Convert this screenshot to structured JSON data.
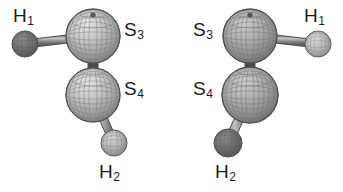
{
  "figure": {
    "background_color": "#ffffff",
    "ink_color": "#1b1b1b",
    "width": 343,
    "height": 192,
    "caption": ""
  },
  "palette": {
    "sulfur_mesh_light": "#cfcfcf",
    "sulfur_mesh_mid": "#9a9a9a",
    "sulfur_mesh_dark": "#6e6e6e",
    "sulfur_outline": "#4f4f4f",
    "hydrogen_dark": "#6b6b6b",
    "hydrogen_light": "#b5b5b5",
    "bond_light": "#b0b0b0",
    "bond_dark": "#6a6a6a",
    "bond_outline": "#4a4a4a"
  },
  "molecules": [
    {
      "id": "molecule-left",
      "name": "disulfane-conformer-left",
      "atoms": [
        {
          "id": "left-h1",
          "element": "H",
          "label": "H",
          "sublabel": "1",
          "kind": "hydrogen",
          "shade": "dark",
          "cx": 25,
          "cy": 44,
          "r": 13,
          "label_x": 13,
          "label_y": 6
        },
        {
          "id": "left-s3",
          "element": "S",
          "label": "S",
          "sublabel": "3",
          "kind": "sulfur",
          "shade": "light",
          "cx": 93,
          "cy": 36,
          "r": 27,
          "label_x": 124,
          "label_y": 20
        },
        {
          "id": "left-s4",
          "element": "S",
          "label": "S",
          "sublabel": "4",
          "kind": "sulfur",
          "shade": "light",
          "cx": 93,
          "cy": 95,
          "r": 27,
          "label_x": 124,
          "label_y": 79
        },
        {
          "id": "left-h2",
          "element": "H",
          "label": "H",
          "sublabel": "2",
          "kind": "hydrogen",
          "shade": "light",
          "cx": 114,
          "cy": 143,
          "r": 13,
          "label_x": 99,
          "label_y": 162
        }
      ],
      "bonds": [
        {
          "id": "left-bond-h1-s3",
          "from": "left-h1",
          "to": "left-s3",
          "width": 7,
          "style": "shaded-cylinder"
        },
        {
          "id": "left-bond-s3-s4",
          "from": "left-s3",
          "to": "left-s4",
          "width": 9,
          "style": "shaded-cylinder"
        },
        {
          "id": "left-bond-s4-h2",
          "from": "left-s4",
          "to": "left-h2",
          "width": 7,
          "style": "shaded-cylinder"
        }
      ]
    },
    {
      "id": "molecule-right",
      "name": "disulfane-conformer-right",
      "atoms": [
        {
          "id": "right-s3",
          "element": "S",
          "label": "S",
          "sublabel": "3",
          "kind": "sulfur",
          "shade": "mid",
          "cx": 79,
          "cy": 36,
          "r": 27,
          "label_x": 22,
          "label_y": 20
        },
        {
          "id": "right-h1",
          "element": "H",
          "label": "H",
          "sublabel": "1",
          "kind": "hydrogen",
          "shade": "light",
          "cx": 147,
          "cy": 44,
          "r": 13,
          "label_x": 133,
          "label_y": 6
        },
        {
          "id": "right-s4",
          "element": "S",
          "label": "S",
          "sublabel": "4",
          "kind": "sulfur",
          "shade": "mid",
          "cx": 79,
          "cy": 95,
          "r": 28,
          "label_x": 22,
          "label_y": 79
        },
        {
          "id": "right-h2",
          "element": "H",
          "label": "H",
          "sublabel": "2",
          "kind": "hydrogen",
          "shade": "dark",
          "cx": 57,
          "cy": 143,
          "r": 14,
          "label_x": 44,
          "label_y": 162
        }
      ],
      "bonds": [
        {
          "id": "right-bond-s3-h1",
          "from": "right-s3",
          "to": "right-h1",
          "width": 7,
          "style": "shaded-cylinder"
        },
        {
          "id": "right-bond-s3-s4",
          "from": "right-s3",
          "to": "right-s4",
          "width": 9,
          "style": "shaded-cylinder"
        },
        {
          "id": "right-bond-s4-h2",
          "from": "right-s4",
          "to": "right-h2",
          "width": 8,
          "style": "shaded-cylinder"
        }
      ]
    }
  ]
}
